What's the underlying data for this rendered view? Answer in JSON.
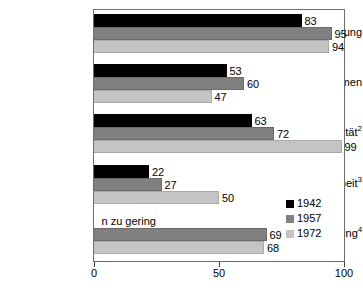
{
  "chart_data": {
    "type": "bar",
    "orientation": "horizontal",
    "title": "",
    "subtitle": "",
    "xlabel": "",
    "ylabel": "",
    "xlim": [
      0,
      100
    ],
    "xticks": [
      0,
      50,
      100
    ],
    "xticklabels": [
      "0",
      "50",
      "100"
    ],
    "grid": false,
    "legend_position": "inside-lower-right",
    "categories": [
      "Ausbildung",
      "Einkommen",
      "Sexualität",
      "Hausarbeit",
      "Kinderversorgung"
    ],
    "category_footnotes": [
      "",
      "",
      "2",
      "3",
      "4"
    ],
    "series": [
      {
        "name": "1942",
        "color": "#000000",
        "values": [
          83,
          53,
          63,
          22,
          null
        ],
        "value_labels": [
          "83",
          "53",
          "63",
          "22",
          null
        ]
      },
      {
        "name": "1957",
        "color": "#808080",
        "values": [
          95,
          60,
          72,
          27,
          69
        ],
        "value_labels": [
          "95",
          "60",
          "72",
          "27",
          "69"
        ]
      },
      {
        "name": "1972",
        "color": "#c4c4c4",
        "values": [
          94,
          47,
          99,
          50,
          68
        ],
        "value_labels": [
          "94",
          "47",
          "99",
          "50",
          "68"
        ]
      }
    ],
    "annotations": [
      {
        "text": "n zu gering",
        "category": "Kinderversorgung",
        "series": "1942",
        "x": 3
      }
    ]
  },
  "legend": {
    "items": [
      {
        "label": "1942",
        "color": "#000000"
      },
      {
        "label": "1957",
        "color": "#808080"
      },
      {
        "label": "1972",
        "color": "#c4c4c4"
      }
    ]
  },
  "colors": {
    "background": "#ffffff",
    "axis": "#6e6e6e",
    "text": "#000000",
    "series_1942": "#000000",
    "series_1957": "#808080",
    "series_1972": "#c4c4c4"
  }
}
